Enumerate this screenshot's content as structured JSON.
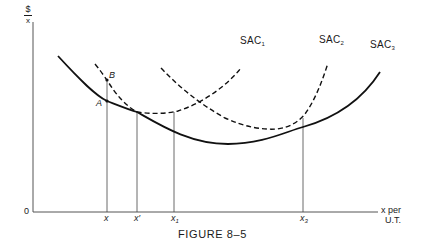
{
  "figure": {
    "title": "FIGURE 8–5",
    "y_axis_label_top": "$",
    "y_axis_label_bottom": "x",
    "x_axis_label_line1": "x per",
    "x_axis_label_line2": "U.T.",
    "origin_label": "0"
  },
  "curves": [
    {
      "name": "SAC",
      "subscript": "1",
      "style": "dashed"
    },
    {
      "name": "SAC",
      "subscript": "2",
      "style": "dashed"
    },
    {
      "name": "SAC",
      "subscript": "3",
      "style": "solid"
    }
  ],
  "points": [
    {
      "label": "A"
    },
    {
      "label": "B"
    }
  ],
  "x_ticks": [
    {
      "base": "x",
      "sub": ""
    },
    {
      "base": "x′",
      "sub": ""
    },
    {
      "base": "x",
      "sub": "1"
    },
    {
      "base": "x",
      "sub": "3"
    }
  ],
  "colors": {
    "ink": "#1a1a1a",
    "axis": "#555555",
    "background": "#ffffff"
  }
}
